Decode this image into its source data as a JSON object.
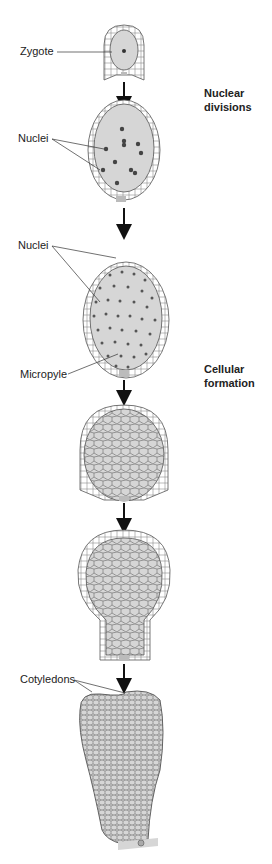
{
  "labels": {
    "zygote": "Zygote",
    "nuclei_1": "Nuclei",
    "nuclei_2": "Nuclei",
    "micropyle": "Micropyle",
    "cotyledons": "Cotyledons"
  },
  "stages": {
    "nuclear_1": "Nuclear",
    "nuclear_2": "divisions",
    "cellular_1": "Cellular",
    "cellular_2": "formation"
  },
  "colors": {
    "fill": "#d6d6d6",
    "outline": "#555555",
    "nucleus": "#4a4a4a",
    "text": "#222222"
  }
}
